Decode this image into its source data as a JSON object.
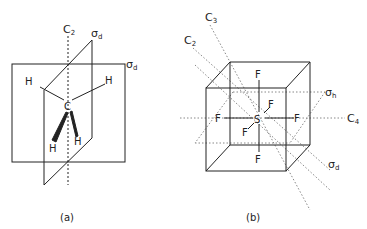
{
  "figure_a": {
    "caption": "(a)",
    "molecule": "CH4",
    "central_atom": "C",
    "ligands": [
      "H",
      "H",
      "H",
      "H"
    ],
    "labels": {
      "axis": "C",
      "axis_sub": "2",
      "plane1": "σ",
      "plane1_sub": "d",
      "plane2": "σ",
      "plane2_sub": "d"
    }
  },
  "figure_b": {
    "caption": "(b)",
    "molecule": "SF6",
    "central_atom": "S",
    "ligands": [
      "F",
      "F",
      "F",
      "F",
      "F",
      "F"
    ],
    "labels": {
      "c3": "C",
      "c3_sub": "3",
      "c2": "C",
      "c2_sub": "2",
      "sigma_h": "σ",
      "sigma_h_sub": "h",
      "c4": "C",
      "c4_sub": "4",
      "sigma_d": "σ",
      "sigma_d_sub": "d"
    }
  }
}
